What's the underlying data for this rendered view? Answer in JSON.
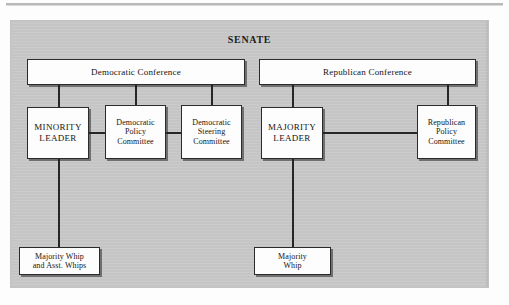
{
  "chart": {
    "title": "SENATE",
    "type": "organization-chart",
    "branches": [
      {
        "id": "democratic",
        "header": "Democratic Conference",
        "nodes": [
          {
            "id": "minority-leader",
            "label": "MINORITY LEADER",
            "lines": [
              "MINORITY",
              "LEADER"
            ]
          },
          {
            "id": "democratic-policy-committee",
            "label": "Democratic Policy Committee",
            "lines": [
              "Democratic",
              "Policy",
              "Committee"
            ]
          },
          {
            "id": "democratic-steering-committee",
            "label": "Democratic Steering Committee",
            "lines": [
              "Democratic",
              "Steering",
              "Committee"
            ]
          },
          {
            "id": "democratic-whip",
            "label": "Majority Whip and Asst. Whips",
            "lines": [
              "Majority Whip",
              "and Asst. Whips"
            ]
          }
        ]
      },
      {
        "id": "republican",
        "header": "Republican Conference",
        "nodes": [
          {
            "id": "majority-leader",
            "label": "MAJORITY LEADER",
            "lines": [
              "MAJORITY",
              "LEADER"
            ]
          },
          {
            "id": "republican-policy-committee",
            "label": "Republican Policy Committee",
            "lines": [
              "Republican",
              "Policy",
              "Committee"
            ]
          },
          {
            "id": "republican-whip",
            "label": "Majority Whip",
            "lines": [
              "Majority",
              "Whip"
            ]
          }
        ]
      }
    ]
  },
  "colors": {
    "panel_background": "#c9c9c9",
    "node_fill": "#fdfdfd",
    "line": "#262626",
    "text": "#141414"
  }
}
